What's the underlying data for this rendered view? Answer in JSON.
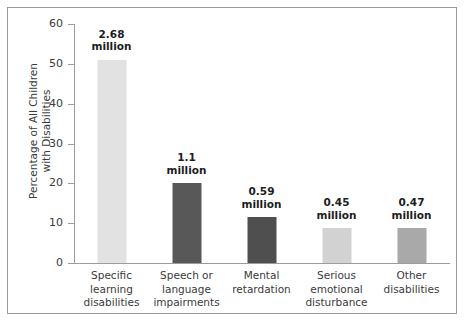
{
  "chart_data": {
    "type": "bar",
    "title": "",
    "subtitle": "",
    "xlabel": "",
    "ylabel": "Percentage of All Children with Disabilities",
    "ylabel_lines": [
      "Percentage of All Children",
      "with Disabilities"
    ],
    "ylim": [
      0,
      60
    ],
    "yticks": [
      0,
      10,
      20,
      30,
      40,
      50,
      60
    ],
    "ytick_labels": [
      "0",
      "10",
      "20",
      "30",
      "40",
      "50",
      "60"
    ],
    "grid": false,
    "legend": null,
    "categories": [
      "Specific learning disabilities",
      "Speech or language impairments",
      "Mental retardation",
      "Serious emotional disturbance",
      "Other disabilities"
    ],
    "category_lines": [
      [
        "Specific",
        "learning",
        "disabilities"
      ],
      [
        "Speech or",
        "language",
        "impairments"
      ],
      [
        "Mental",
        "retardation"
      ],
      [
        "Serious",
        "emotional",
        "disturbance"
      ],
      [
        "Other",
        "disabilities"
      ]
    ],
    "values": [
      51,
      20,
      11.5,
      8.7,
      8.7
    ],
    "data_labels": [
      [
        "2.68",
        "million"
      ],
      [
        "1.1",
        "million"
      ],
      [
        "0.59",
        "million"
      ],
      [
        "0.45",
        "million"
      ],
      [
        "0.47",
        "million"
      ]
    ],
    "counts_millions": [
      2.68,
      1.1,
      0.59,
      0.45,
      0.47
    ],
    "bar_colors": [
      "#e2e2e2",
      "#585858",
      "#4f4f4f",
      "#d2d2d2",
      "#a9a9a9"
    ]
  },
  "colors": {
    "axis": "#9c9c9c",
    "frame": "#9a9a9a",
    "text": "#3b3b3b",
    "label_text": "#1d1d1d",
    "background": "#ffffff"
  }
}
